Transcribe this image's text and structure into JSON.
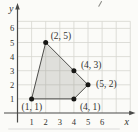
{
  "chart_data": {
    "type": "scatter",
    "title": "",
    "xlabel": "x",
    "ylabel": "y",
    "x_tick_labels": [
      "1",
      "2",
      "3",
      "4",
      "5",
      "6"
    ],
    "y_tick_labels": [
      "1",
      "2",
      "3",
      "4",
      "5",
      "6"
    ],
    "xlim": [
      0,
      8
    ],
    "ylim": [
      0,
      6.5
    ],
    "grid": true,
    "grid_x_lines": [
      1,
      2,
      3,
      4,
      5,
      6,
      7,
      8
    ],
    "grid_y_lines": [
      1,
      2,
      3,
      4,
      5,
      6,
      6.5
    ],
    "points": [
      {
        "x": 2,
        "y": 5,
        "label": "(2, 5)",
        "label_offset": [
          5,
          -4
        ]
      },
      {
        "x": 4,
        "y": 3,
        "label": "(4, 3)",
        "label_offset": [
          7,
          -3
        ]
      },
      {
        "x": 5,
        "y": 2,
        "label": "(5, 2)",
        "label_offset": [
          8,
          2
        ]
      },
      {
        "x": 4,
        "y": 1,
        "label": "(4, 1)",
        "label_offset": [
          6,
          11
        ]
      },
      {
        "x": 1,
        "y": 1,
        "label": "(1, 1)",
        "label_offset": [
          -10,
          11
        ]
      }
    ],
    "polygon": [
      [
        1,
        1
      ],
      [
        2,
        5
      ],
      [
        4,
        3
      ],
      [
        5,
        2
      ],
      [
        4,
        1
      ]
    ],
    "legend": null
  },
  "colors": {
    "background": "#fbfbf8",
    "grid": "#d5d5cf",
    "axis": "#4a4a48",
    "text": "#333330",
    "shape_fill": "rgba(150, 150, 144, 0.28)",
    "shape_stroke": "#4d4d4a",
    "point": "#171715"
  }
}
